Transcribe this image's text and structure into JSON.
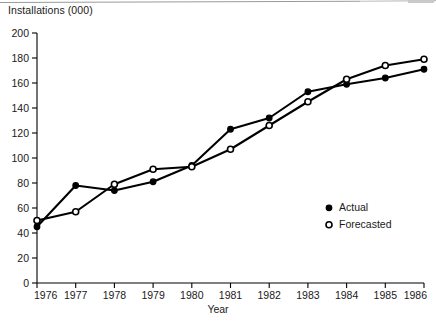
{
  "chart_data": {
    "type": "line",
    "title": "",
    "ylabel": "Installations (000)",
    "xlabel": "Year",
    "categories": [
      "1976",
      "1977",
      "1978",
      "1979",
      "1980",
      "1981",
      "1982",
      "1983",
      "1984",
      "1985",
      "1986"
    ],
    "x": [
      1976,
      1977,
      1978,
      1979,
      1980,
      1981,
      1982,
      1983,
      1984,
      1985,
      1986
    ],
    "series": [
      {
        "name": "Actual",
        "marker": "filled-circle",
        "color": "#000000",
        "values": [
          45,
          78,
          74,
          81,
          94,
          123,
          132,
          153,
          159,
          164,
          171
        ]
      },
      {
        "name": "Forecasted",
        "marker": "open-circle",
        "color": "#000000",
        "values": [
          50,
          57,
          79,
          91,
          93,
          107,
          126,
          145,
          163,
          174,
          179
        ]
      }
    ],
    "ylim": [
      0,
      200
    ],
    "xlim": [
      1976,
      1986
    ],
    "yticks": [
      0,
      20,
      40,
      60,
      80,
      100,
      120,
      140,
      160,
      180,
      200
    ],
    "ytick_labels": [
      "0",
      "20",
      "40",
      "60",
      "80",
      "100",
      "120",
      "140",
      "160",
      "180",
      "200"
    ],
    "xticks": [
      1976,
      1977,
      1978,
      1979,
      1980,
      1981,
      1982,
      1983,
      1984,
      1985,
      1986
    ],
    "xtick_labels": [
      "1976",
      "1977",
      "1978",
      "1979",
      "1980",
      "1981",
      "1982",
      "1983",
      "1984",
      "1985",
      "1986"
    ],
    "grid": false,
    "legend_position": "inside-right-lower",
    "legend": [
      {
        "label": "Actual",
        "marker": "filled-circle"
      },
      {
        "label": "Forecasted",
        "marker": "open-circle"
      }
    ]
  },
  "axis": {
    "y_title": "Installations (000)",
    "x_title": "Year"
  },
  "legend": {
    "actual_label": "Actual",
    "forecasted_label": "Forecasted"
  }
}
